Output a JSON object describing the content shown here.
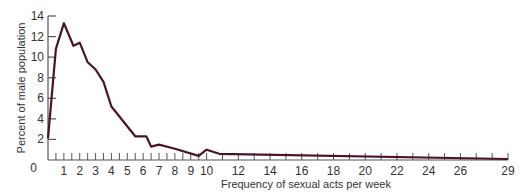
{
  "chart_data": {
    "type": "line",
    "title": "",
    "xlabel": "Frequency of sexual acts per week",
    "ylabel": "Percent of male population",
    "xlim": [
      0,
      29
    ],
    "ylim": [
      0,
      14
    ],
    "grid": false,
    "legend": null,
    "line_color": "#4a1520",
    "axis_color": "#555555",
    "y_ticks": [
      0,
      2,
      4,
      6,
      8,
      10,
      12,
      14
    ],
    "x_tick_labels": [
      "0",
      "1",
      "2",
      "3",
      "4",
      "5",
      "6",
      "7",
      "8",
      "9",
      "10",
      "12",
      "14",
      "16",
      "18",
      "20",
      "22",
      "24",
      "26",
      "29"
    ],
    "x_tick_values": [
      0,
      1,
      2,
      3,
      4,
      5,
      6,
      7,
      8,
      9,
      10,
      12,
      14,
      16,
      18,
      20,
      22,
      24,
      26,
      29
    ],
    "series": [
      {
        "name": "Percent of male population",
        "x": [
          0.0,
          0.5,
          1.0,
          1.6,
          2.0,
          2.5,
          3.0,
          3.5,
          4.0,
          5.5,
          6.2,
          6.5,
          7.0,
          8.0,
          9.5,
          10.0,
          10.8,
          29.0
        ],
        "y": [
          2.1,
          10.8,
          13.3,
          11.1,
          11.4,
          9.5,
          8.8,
          7.6,
          5.2,
          2.3,
          2.3,
          1.3,
          1.5,
          1.1,
          0.4,
          1.0,
          0.6,
          0.1
        ]
      }
    ]
  }
}
